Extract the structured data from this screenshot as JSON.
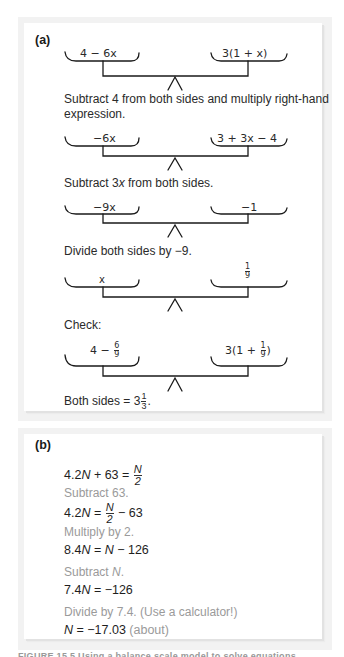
{
  "panel_a": {
    "label": "(a)",
    "scales": [
      {
        "left": "4 − 6x",
        "right": "3(1 + x)"
      },
      {
        "left": "−6x",
        "right": "3 + 3x − 4"
      },
      {
        "left": "−9x",
        "right": "−1"
      },
      {
        "left": "x",
        "right_frac": {
          "num": "1",
          "den": "9"
        }
      },
      {
        "left_prefix": "4 −",
        "left_frac": {
          "num": "6",
          "den": "9"
        },
        "right_prefix": "3(1 +",
        "right_frac": {
          "num": "1",
          "den": "9"
        },
        "right_suffix": ")"
      }
    ],
    "notes": {
      "step1_line1": "Subtract 4 from both sides and multiply right-hand",
      "step1_line2": "expression.",
      "step2_pre": "Subtract 3",
      "step2_var": "x",
      "step2_post": " from both sides.",
      "step3": "Divide both sides by −9.",
      "check": "Check:",
      "result_pre": "Both sides = 3",
      "result_frac": {
        "num": "1",
        "den": "3"
      },
      "result_post": "."
    }
  },
  "panel_b": {
    "label": "(b)",
    "lines": {
      "eq1_left": "4.2",
      "eq1_var": "N",
      "eq1_mid": " + 63 = ",
      "eq1_frac": {
        "num": "N",
        "den": "2"
      },
      "step1": "Subtract 63.",
      "eq2_left": "4.2",
      "eq2_var": "N",
      "eq2_mid": " = ",
      "eq2_frac": {
        "num": "N",
        "den": "2"
      },
      "eq2_post": " − 63",
      "step2": "Multiply by 2.",
      "eq3_left": "8.4",
      "eq3_var": "N",
      "eq3_mid": " = ",
      "eq3_var2": "N",
      "eq3_post": " − 126",
      "step3_pre": "Subtract ",
      "step3_var": "N",
      "step3_post": ".",
      "eq4_left": "7.4",
      "eq4_var": "N",
      "eq4_post": " = −126",
      "step4": "Divide by 7.4. (Use a calculator!)",
      "eq5_var": "N",
      "eq5_post": " = −17.03",
      "eq5_note": " (about)"
    }
  },
  "caption": "FIGURE 15.5  Using a balance scale model to solve equations"
}
